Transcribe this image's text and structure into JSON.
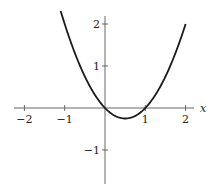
{
  "chart_data": {
    "type": "line",
    "title": "",
    "xlabel": "x",
    "ylabel": "",
    "function": "y = x^2 - x",
    "xlim": [
      -2.2,
      2.2
    ],
    "ylim": [
      -1.8,
      2.2
    ],
    "x_ticks": [
      -2,
      -1,
      1,
      2
    ],
    "y_ticks": [
      2,
      1,
      -1
    ],
    "x_tick_labels": [
      "−2",
      "−1",
      "1",
      "2"
    ],
    "y_tick_labels": [
      "2",
      "1",
      "−1"
    ],
    "series": [
      {
        "name": "parabola",
        "x": [
          -1.1,
          -1,
          -0.5,
          0,
          0.25,
          0.5,
          0.75,
          1,
          1.5,
          2
        ],
        "y": [
          2.31,
          2,
          0.75,
          0,
          -0.1875,
          -0.25,
          -0.1875,
          0,
          0.75,
          2
        ]
      }
    ],
    "grid": false,
    "legend": null
  },
  "colors": {
    "axis": "#555555",
    "curve": "#1a1a1a"
  }
}
